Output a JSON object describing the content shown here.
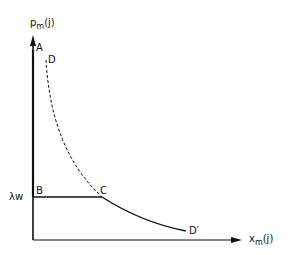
{
  "diagram": {
    "y_axis_label": "p",
    "y_axis_sub": "m",
    "y_axis_arg": "(j)",
    "x_axis_label": "x",
    "x_axis_sub": "m",
    "x_axis_arg": "(j)",
    "level_label": "λw",
    "points": {
      "A": "A",
      "B": "B",
      "C": "C",
      "D": "D",
      "D_prime": "D′"
    },
    "colors": {
      "line": "#111111",
      "background": "#ffffff"
    }
  }
}
